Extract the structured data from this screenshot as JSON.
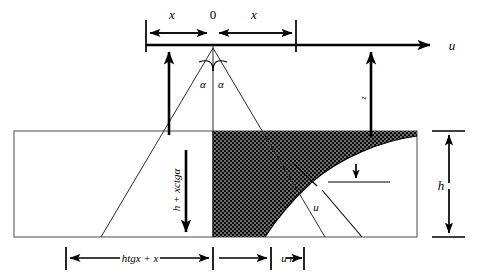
{
  "figure": {
    "labels": {
      "origin": "0",
      "x_left": "x",
      "x_right": "x",
      "axis_u": "u",
      "alpha_left": "α",
      "alpha_right": "α",
      "depth_z": "z",
      "vertical_dim": "h + xctgα",
      "curve_u": "u",
      "bottom_dim_left": "htgx + x",
      "bottom_dim_right": "u n",
      "layer_h": "h"
    },
    "colors": {
      "stroke": "#000000",
      "thin_stroke": "#2b2b2b",
      "frame_stroke": "#6a6a6a",
      "fill_hatch": "#111111",
      "background": "#ffffff"
    },
    "geometry": {
      "axis_y": 45,
      "apex_x": 213,
      "rect_left": 14,
      "rect_right": 417,
      "rect_top": 131,
      "rect_bottom": 237,
      "tick_left_x": 146,
      "tick_right_x": 296,
      "arrow_left_x": 169,
      "arrow_right_x": 371
    }
  }
}
